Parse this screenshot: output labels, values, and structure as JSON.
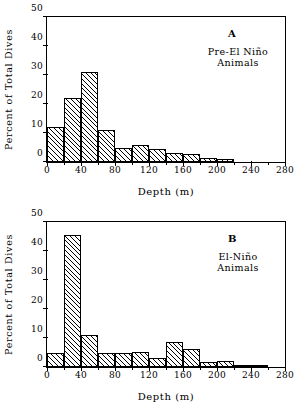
{
  "figure": {
    "xlabel": "Depth (m)",
    "ylabel": "Percent of Total Dives"
  },
  "chart_data": [
    {
      "type": "bar",
      "panel": "A",
      "panel_letter": "A",
      "caption_line1": "Pre-El Niño",
      "caption_line2": "Animals",
      "title": "",
      "xlabel": "Depth (m)",
      "ylabel": "Percent of Total Dives",
      "xlim": [
        0,
        280
      ],
      "ylim": [
        0,
        50
      ],
      "xticks": [
        0,
        40,
        80,
        120,
        160,
        200,
        240,
        280
      ],
      "xticklabels": [
        "0",
        "40",
        "80",
        "120",
        "160",
        "200",
        "240",
        "280"
      ],
      "yticks": [
        0,
        10,
        20,
        30,
        40,
        50
      ],
      "yticklabels": [
        "0",
        "10",
        "20",
        "30",
        "40",
        "50"
      ],
      "grid": false,
      "legend": "none",
      "bin_width": 20,
      "bin_edges": [
        0,
        20,
        40,
        60,
        80,
        100,
        120,
        140,
        160,
        180,
        200,
        220,
        240,
        260,
        280
      ],
      "categories": [
        "0-20",
        "20-40",
        "40-60",
        "60-80",
        "80-100",
        "100-120",
        "120-140",
        "140-160",
        "160-180",
        "180-200",
        "200-220",
        "220-240",
        "240-260",
        "260-280"
      ],
      "values": [
        12.0,
        22.0,
        31.0,
        11.0,
        5.0,
        6.0,
        4.5,
        3.2,
        2.6,
        1.5,
        1.0,
        0.0,
        0.0,
        0.0
      ]
    },
    {
      "type": "bar",
      "panel": "B",
      "panel_letter": "B",
      "caption_line1": "El-Niño",
      "caption_line2": "Animals",
      "title": "",
      "xlabel": "Depth (m)",
      "ylabel": "Percent of Total Dives",
      "xlim": [
        0,
        280
      ],
      "ylim": [
        0,
        50
      ],
      "xticks": [
        0,
        40,
        80,
        120,
        160,
        200,
        240,
        280
      ],
      "xticklabels": [
        "0",
        "40",
        "80",
        "120",
        "160",
        "200",
        "240",
        "280"
      ],
      "yticks": [
        0,
        10,
        20,
        30,
        40,
        50
      ],
      "yticklabels": [
        "0",
        "10",
        "20",
        "30",
        "40",
        "50"
      ],
      "grid": false,
      "legend": "none",
      "bin_width": 20,
      "bin_edges": [
        0,
        20,
        40,
        60,
        80,
        100,
        120,
        140,
        160,
        180,
        200,
        220,
        240,
        260,
        280
      ],
      "categories": [
        "0-20",
        "20-40",
        "40-60",
        "60-80",
        "80-100",
        "100-120",
        "120-140",
        "140-160",
        "160-180",
        "180-200",
        "200-220",
        "220-240",
        "240-260",
        "260-280"
      ],
      "values": [
        5.0,
        45.6,
        11.0,
        5.0,
        5.0,
        5.3,
        3.2,
        8.7,
        6.1,
        1.7,
        2.0,
        0.6,
        0.5,
        0.0
      ]
    }
  ]
}
